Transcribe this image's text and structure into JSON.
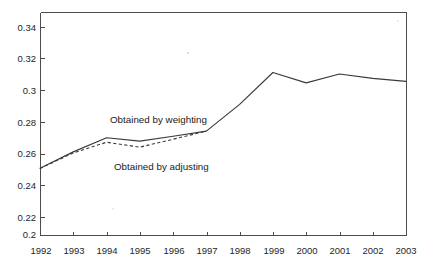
{
  "chart_data": {
    "type": "line",
    "title": "",
    "subtitle": "",
    "xlabel": "",
    "ylabel": "",
    "x": [
      1992,
      1993,
      1994,
      1995,
      1996,
      1997,
      1998,
      1999,
      2000,
      2001,
      2002,
      2003
    ],
    "xtick_labels": [
      "1992",
      "1993",
      "1994",
      "1995",
      "1996",
      "1997",
      "1998",
      "1999",
      "2000",
      "2001",
      "2002",
      "2003"
    ],
    "ytick_labels": [
      "0.2",
      "0.22",
      "0.24",
      "0.26",
      "0.28",
      "0.3",
      "0.32",
      "0.34"
    ],
    "ytick_values": [
      0.2,
      0.22,
      0.24,
      0.26,
      0.28,
      0.3,
      0.32,
      0.34
    ],
    "xlim": [
      1992,
      2003
    ],
    "ylim": [
      0.2,
      0.35
    ],
    "grid": false,
    "legend_position": "inline-annotation",
    "series": [
      {
        "name": "Obtained by weighting",
        "style": "solid",
        "color": "#3a3a3a",
        "x": [
          1992,
          1993,
          1994,
          1995,
          1996,
          1997,
          1998,
          1999,
          2000,
          2001,
          2002,
          2003
        ],
        "values": [
          0.245,
          0.256,
          0.2655,
          0.2632,
          0.2665,
          0.27,
          0.288,
          0.3095,
          0.3025,
          0.3085,
          0.3055,
          0.3035
        ]
      },
      {
        "name": "Obtained by adjusting",
        "style": "dashed",
        "color": "#3a3a3a",
        "x": [
          1992,
          1993,
          1994,
          1995,
          1996,
          1997
        ],
        "values": [
          0.2448,
          0.2553,
          0.2625,
          0.2592,
          0.2645,
          0.27
        ]
      }
    ],
    "annotations": [
      {
        "id": "label-weighting",
        "text": "Obtained by weighting",
        "x_px": 110,
        "y_px": 123
      },
      {
        "id": "label-adjusting",
        "text": "Obtained by adjusting",
        "x_px": 114,
        "y_px": 170
      }
    ],
    "axis_color": "#4c4c4c",
    "background_color": "#ffffff"
  },
  "figure": {
    "plot_left_px": 40,
    "plot_right_px": 406,
    "plot_top_px": 12,
    "plot_bottom_px": 235
  }
}
